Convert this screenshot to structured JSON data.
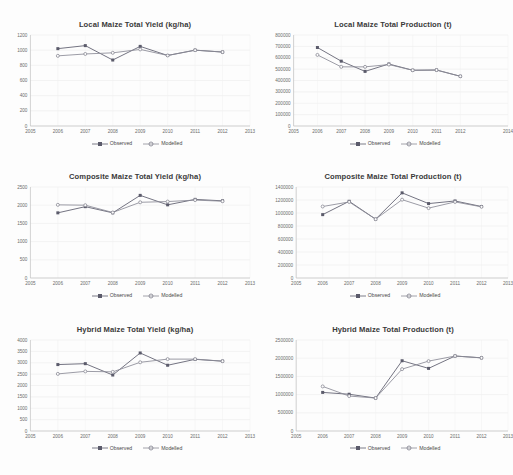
{
  "page": {
    "background_color": "#fdfdfd",
    "layout": "2-column by 3-row grid of line charts"
  },
  "legend_common": {
    "observed_label": "Observed",
    "modelled_label": "Modelled",
    "observed_color": "#5b5b6b",
    "modelled_color": "#8a8a96"
  },
  "chart_data": [
    {
      "id": "local-maize-total-yield",
      "type": "line",
      "title": "Local Maize Total Yield (kg/ha)",
      "xlabel": "",
      "ylabel": "",
      "x": [
        2006,
        2007,
        2008,
        2009,
        2010,
        2011,
        2012
      ],
      "xlim": [
        2005,
        2013
      ],
      "xticks": [
        2005,
        2006,
        2007,
        2008,
        2009,
        2010,
        2011,
        2012,
        2013
      ],
      "ylim": [
        0,
        1200
      ],
      "yticks": [
        0,
        200,
        400,
        600,
        800,
        1000,
        1200
      ],
      "grid": true,
      "legend_position": "bottom",
      "series": [
        {
          "name": "Observed",
          "values": [
            1020,
            1060,
            870,
            1050,
            930,
            1000,
            975
          ]
        },
        {
          "name": "Modelled",
          "values": [
            925,
            950,
            965,
            1010,
            930,
            1000,
            975
          ]
        }
      ]
    },
    {
      "id": "local-maize-total-production",
      "type": "line",
      "title": "Local Maize Total Production (t)",
      "xlabel": "",
      "ylabel": "",
      "x": [
        2006,
        2007,
        2008,
        2009,
        2010,
        2011,
        2012
      ],
      "xlim": [
        2005,
        2014
      ],
      "xticks": [
        2005,
        2006,
        2007,
        2008,
        2009,
        2010,
        2011,
        2012,
        2014
      ],
      "ylim": [
        0,
        800000
      ],
      "yticks": [
        0,
        100000,
        200000,
        300000,
        400000,
        500000,
        600000,
        700000,
        800000
      ],
      "grid": true,
      "legend_position": "bottom",
      "series": [
        {
          "name": "Observed",
          "values": [
            690000,
            570000,
            480000,
            545000,
            490000,
            492000,
            437000
          ]
        },
        {
          "name": "Modelled",
          "values": [
            625000,
            520000,
            520000,
            540000,
            490000,
            492000,
            437000
          ]
        }
      ]
    },
    {
      "id": "composite-maize-total-yield",
      "type": "line",
      "title": "Composite Maize Total Yield (kg/ha)",
      "xlabel": "",
      "ylabel": "",
      "x": [
        2006,
        2007,
        2008,
        2009,
        2010,
        2011,
        2012
      ],
      "xlim": [
        2005,
        2013
      ],
      "xticks": [
        2005,
        2006,
        2007,
        2008,
        2009,
        2010,
        2011,
        2012,
        2013
      ],
      "ylim": [
        0,
        2500
      ],
      "yticks": [
        0,
        500,
        1000,
        1500,
        2000,
        2500
      ],
      "grid": true,
      "legend_position": "bottom",
      "series": [
        {
          "name": "Observed",
          "values": [
            1790,
            1960,
            1790,
            2270,
            2010,
            2160,
            2120
          ]
        },
        {
          "name": "Modelled",
          "values": [
            2010,
            2000,
            1800,
            2080,
            2100,
            2140,
            2110
          ]
        }
      ]
    },
    {
      "id": "composite-maize-total-production",
      "type": "line",
      "title": "Composite Maize Total Production (t)",
      "xlabel": "",
      "ylabel": "",
      "x": [
        2006,
        2007,
        2008,
        2009,
        2010,
        2011,
        2012
      ],
      "xlim": [
        2005,
        2013
      ],
      "xticks": [
        2005,
        2006,
        2007,
        2008,
        2009,
        2010,
        2011,
        2012,
        2013
      ],
      "ylim": [
        0,
        1400000
      ],
      "yticks": [
        0,
        200000,
        400000,
        600000,
        800000,
        1000000,
        1200000,
        1400000
      ],
      "grid": true,
      "legend_position": "bottom",
      "series": [
        {
          "name": "Observed",
          "values": [
            975000,
            1180000,
            905000,
            1310000,
            1145000,
            1185000,
            1100000
          ]
        },
        {
          "name": "Modelled",
          "values": [
            1100000,
            1170000,
            905000,
            1205000,
            1075000,
            1170000,
            1095000
          ]
        }
      ]
    },
    {
      "id": "hybrid-maize-total-yield",
      "type": "line",
      "title": "Hybrid Maize Total Yield (kg/ha)",
      "xlabel": "",
      "ylabel": "",
      "x": [
        2006,
        2007,
        2008,
        2009,
        2010,
        2011,
        2012
      ],
      "xlim": [
        2005,
        2013
      ],
      "xticks": [
        2005,
        2006,
        2007,
        2008,
        2009,
        2010,
        2011,
        2012,
        2013
      ],
      "ylim": [
        0,
        4000
      ],
      "yticks": [
        0,
        500,
        1000,
        1500,
        2000,
        2500,
        3000,
        3500,
        4000
      ],
      "grid": true,
      "legend_position": "bottom",
      "series": [
        {
          "name": "Observed",
          "values": [
            2920,
            2960,
            2460,
            3430,
            2890,
            3150,
            3070
          ]
        },
        {
          "name": "Modelled",
          "values": [
            2510,
            2620,
            2600,
            3020,
            3160,
            3160,
            3070
          ]
        }
      ]
    },
    {
      "id": "hybrid-maize-total-production",
      "type": "line",
      "title": "Hybrid Maize Total Production (t)",
      "xlabel": "",
      "ylabel": "",
      "x": [
        2006,
        2007,
        2008,
        2009,
        2010,
        2011,
        2012
      ],
      "xlim": [
        2005,
        2013
      ],
      "xticks": [
        2005,
        2006,
        2007,
        2008,
        2009,
        2010,
        2011,
        2012,
        2013
      ],
      "ylim": [
        0,
        2500000
      ],
      "yticks": [
        0,
        500000,
        1000000,
        1500000,
        2000000,
        2500000
      ],
      "grid": true,
      "legend_position": "bottom",
      "series": [
        {
          "name": "Observed",
          "values": [
            1060000,
            1010000,
            905000,
            1930000,
            1720000,
            2060000,
            2010000
          ]
        },
        {
          "name": "Modelled",
          "values": [
            1225000,
            960000,
            905000,
            1700000,
            1920000,
            2060000,
            2010000
          ]
        }
      ]
    }
  ]
}
